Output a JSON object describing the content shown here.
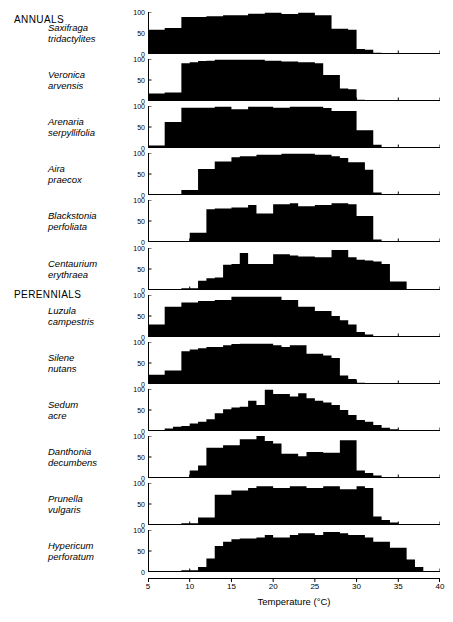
{
  "headings": {
    "annuals": "ANNUALS",
    "perennials": "PERENNIALS"
  },
  "axis": {
    "x_title": "Temperature (°C)",
    "x_ticks": [
      5,
      10,
      15,
      20,
      25,
      30,
      35,
      40
    ],
    "y_ticks": [
      0,
      50,
      100
    ]
  },
  "chart_data": {
    "type": "bar",
    "title": "",
    "xlabel": "Temperature (°C)",
    "ylabel": "",
    "xlim": [
      5,
      40
    ],
    "ylim": [
      0,
      100
    ],
    "grid": false,
    "legend": "none",
    "bin_width": 1,
    "bin_centers": [
      5.5,
      6.5,
      7.5,
      8.5,
      9.5,
      10.5,
      11.5,
      12.5,
      13.5,
      14.5,
      15.5,
      16.5,
      17.5,
      18.5,
      19.5,
      20.5,
      21.5,
      22.5,
      23.5,
      24.5,
      25.5,
      26.5,
      27.5,
      28.5,
      29.5,
      30.5,
      31.5,
      32.5,
      33.5,
      34.5,
      35.5,
      36.5,
      37.5,
      38.5,
      39.5
    ],
    "note": "Each panel is a histogram of germination percentage (0-100) against temperature (5-40 C).",
    "panels": [
      {
        "group": "ANNUALS",
        "species": "Saxifraga tridactylites",
        "label_lines": [
          "Saxifraga",
          "tridactylites"
        ],
        "values": [
          58,
          58,
          62,
          62,
          88,
          88,
          88,
          90,
          90,
          92,
          92,
          92,
          96,
          96,
          98,
          98,
          95,
          95,
          98,
          98,
          92,
          92,
          60,
          60,
          58,
          12,
          10,
          3,
          0,
          0,
          0,
          0,
          0,
          0,
          0
        ]
      },
      {
        "group": "ANNUALS",
        "species": "Veronica arvensis",
        "label_lines": [
          "Veronica",
          "arvensis"
        ],
        "values": [
          18,
          18,
          20,
          20,
          90,
          92,
          95,
          96,
          98,
          98,
          98,
          98,
          98,
          98,
          96,
          96,
          94,
          94,
          92,
          92,
          90,
          62,
          62,
          30,
          28,
          3,
          0,
          0,
          0,
          0,
          0,
          0,
          0,
          0,
          0
        ]
      },
      {
        "group": "ANNUALS",
        "species": "Arenaria serpyllifolia",
        "label_lines": [
          "Arenaria",
          "serpyllifolia"
        ],
        "values": [
          6,
          6,
          62,
          62,
          96,
          96,
          96,
          96,
          98,
          98,
          92,
          92,
          98,
          98,
          98,
          96,
          96,
          98,
          98,
          98,
          98,
          95,
          88,
          88,
          88,
          42,
          42,
          8,
          2,
          0,
          0,
          0,
          0,
          0,
          0
        ]
      },
      {
        "group": "ANNUALS",
        "species": "Aira praecox",
        "label_lines": [
          "Aira",
          "praecox"
        ],
        "values": [
          0,
          0,
          0,
          0,
          12,
          12,
          62,
          62,
          80,
          80,
          90,
          92,
          92,
          96,
          96,
          96,
          98,
          98,
          98,
          98,
          96,
          96,
          92,
          88,
          78,
          78,
          60,
          6,
          0,
          0,
          0,
          0,
          0,
          0,
          0
        ]
      },
      {
        "group": "ANNUALS",
        "species": "Blackstonia perfoliata",
        "label_lines": [
          "Blackstonia",
          "perfoliata"
        ],
        "values": [
          0,
          0,
          0,
          0,
          0,
          22,
          22,
          78,
          80,
          80,
          82,
          82,
          88,
          68,
          68,
          90,
          90,
          92,
          85,
          85,
          88,
          88,
          92,
          92,
          90,
          62,
          62,
          6,
          2,
          0,
          0,
          0,
          0,
          0,
          0
        ]
      },
      {
        "group": "ANNUALS",
        "species": "Centaurium erythraea",
        "label_lines": [
          "Centaurium",
          "erythraea"
        ],
        "values": [
          0,
          0,
          0,
          0,
          4,
          4,
          22,
          28,
          30,
          60,
          62,
          88,
          62,
          62,
          62,
          85,
          85,
          82,
          80,
          80,
          78,
          78,
          95,
          95,
          78,
          72,
          70,
          68,
          62,
          20,
          20,
          2,
          0,
          0,
          0
        ]
      },
      {
        "group": "PERENNIALS",
        "species": "Luzula campestris",
        "label_lines": [
          "Luzula",
          "campestris"
        ],
        "values": [
          30,
          30,
          72,
          72,
          82,
          82,
          86,
          86,
          88,
          88,
          96,
          96,
          96,
          96,
          96,
          96,
          88,
          88,
          72,
          72,
          62,
          62,
          50,
          40,
          30,
          12,
          6,
          2,
          0,
          0,
          0,
          0,
          0,
          0,
          0
        ]
      },
      {
        "group": "PERENNIALS",
        "species": "Silene nutans",
        "label_lines": [
          "Silene",
          "nutans"
        ],
        "values": [
          22,
          22,
          32,
          32,
          78,
          82,
          85,
          88,
          88,
          92,
          95,
          96,
          96,
          96,
          96,
          92,
          88,
          92,
          92,
          72,
          72,
          68,
          62,
          20,
          12,
          3,
          0,
          0,
          0,
          0,
          0,
          0,
          0,
          0
        ]
      },
      {
        "group": "PERENNIALS",
        "species": "Sedum acre",
        "label_lines": [
          "Sedum",
          "acre"
        ],
        "values": [
          0,
          0,
          6,
          10,
          12,
          18,
          22,
          28,
          42,
          52,
          56,
          58,
          72,
          62,
          98,
          88,
          88,
          82,
          90,
          78,
          72,
          68,
          62,
          50,
          38,
          26,
          22,
          14,
          8,
          4,
          2,
          0,
          0,
          0,
          0
        ]
      },
      {
        "group": "PERENNIALS",
        "species": "Danthonia decumbens",
        "label_lines": [
          "Danthonia",
          "decumbens"
        ],
        "values": [
          0,
          0,
          0,
          2,
          2,
          18,
          30,
          72,
          72,
          78,
          78,
          92,
          92,
          100,
          88,
          82,
          58,
          58,
          52,
          62,
          62,
          60,
          60,
          90,
          90,
          18,
          12,
          6,
          2,
          0,
          0,
          0,
          0,
          0,
          0
        ]
      },
      {
        "group": "PERENNIALS",
        "species": "Prunella vulgaris",
        "label_lines": [
          "Prunella",
          "vulgaris"
        ],
        "values": [
          0,
          0,
          0,
          0,
          4,
          4,
          18,
          18,
          72,
          72,
          82,
          82,
          88,
          92,
          92,
          88,
          88,
          92,
          92,
          88,
          88,
          92,
          92,
          85,
          85,
          92,
          88,
          20,
          12,
          6,
          2,
          0,
          0,
          0,
          0
        ]
      },
      {
        "group": "PERENNIALS",
        "species": "Hypericum perforatum",
        "label_lines": [
          "Hypericum",
          "perforatum"
        ],
        "values": [
          0,
          0,
          0,
          0,
          4,
          4,
          12,
          32,
          62,
          72,
          78,
          80,
          80,
          82,
          88,
          82,
          82,
          88,
          92,
          92,
          88,
          95,
          95,
          92,
          88,
          88,
          82,
          72,
          72,
          58,
          58,
          30,
          12,
          2,
          0
        ]
      }
    ]
  }
}
